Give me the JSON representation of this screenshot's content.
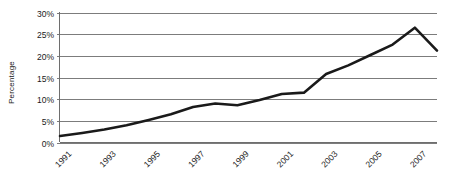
{
  "chart_data": {
    "type": "line",
    "title": "",
    "xlabel": "",
    "ylabel": "Percentage",
    "ylim": [
      0,
      30
    ],
    "ytick_labels": [
      "0%",
      "5%",
      "10%",
      "15%",
      "20%",
      "25%",
      "30%"
    ],
    "ytick_values": [
      0,
      5,
      10,
      15,
      20,
      25,
      30
    ],
    "xtick_labels": [
      "1991",
      "1993",
      "1995",
      "1997",
      "1999",
      "2001",
      "2003",
      "2005",
      "2007"
    ],
    "xtick_values": [
      1991,
      1993,
      1995,
      1997,
      1999,
      2001,
      2003,
      2005,
      2007
    ],
    "xlim": [
      1991,
      2008
    ],
    "grid": "horizontal",
    "legend": "none",
    "series": [
      {
        "name": "Percentage",
        "x": [
          1991,
          1992,
          1993,
          1994,
          1995,
          1996,
          1997,
          1998,
          1999,
          2000,
          2001,
          2002,
          2003,
          2004,
          2005,
          2006,
          2007,
          2008
        ],
        "values": [
          1.5,
          2.2,
          3.0,
          4.0,
          5.2,
          6.5,
          8.2,
          9.0,
          8.6,
          9.8,
          11.2,
          11.5,
          15.8,
          17.8,
          20.2,
          22.6,
          26.5,
          21.2
        ],
        "color": "#1a1a1a"
      }
    ],
    "colors": {
      "line": "#1a1a1a",
      "gridline": "#7c7c7c",
      "axis": "#6e6e6e",
      "text": "#1a1a1a",
      "background": "#ffffff"
    }
  }
}
